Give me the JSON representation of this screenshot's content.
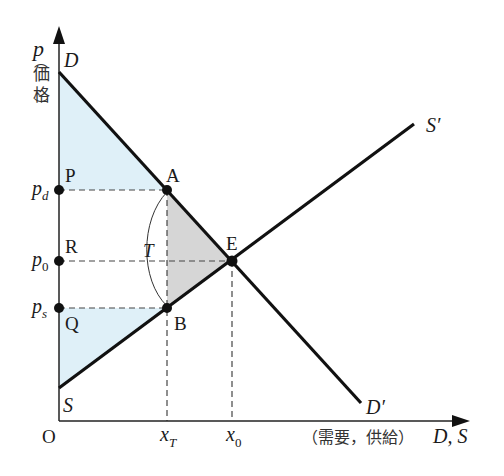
{
  "diagram": {
    "type": "supply-demand-tax",
    "colors": {
      "line": "#111111",
      "surplus_fill": "#dff0f8",
      "deadweight_fill": "#d6d6d6",
      "dashed": "#444444"
    },
    "y_axis": {
      "symbol": "p",
      "label_jp": "価格",
      "paren_open": "︵",
      "paren_close": "︶"
    },
    "x_axis": {
      "label_jp": "（需要，供給）",
      "symbol": "D, S",
      "origin": "O"
    },
    "curves": {
      "demand_start": "D",
      "demand_end": "D′",
      "supply_start": "S",
      "supply_end": "S′"
    },
    "points": {
      "A": "A",
      "B": "B",
      "E": "E",
      "P": "P",
      "R": "R",
      "Q": "Q"
    },
    "price_ticks": {
      "pd_base": "p",
      "pd_sub": "d",
      "p0_base": "p",
      "p0_sub": "0",
      "ps_base": "p",
      "ps_sub": "s"
    },
    "quantity_ticks": {
      "xT_base": "x",
      "xT_sub": "T",
      "x0_base": "x",
      "x0_sub": "0"
    },
    "tax_label": "T"
  }
}
